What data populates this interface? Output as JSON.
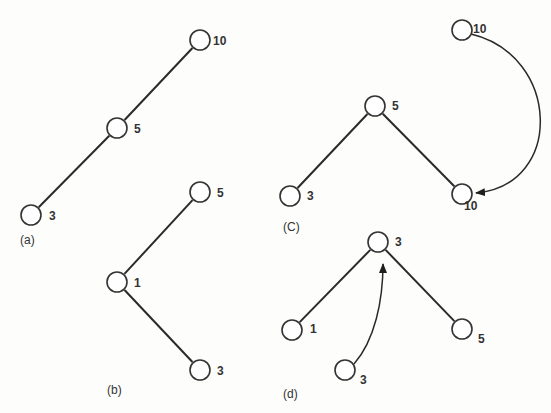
{
  "figure": {
    "node_radius": 10,
    "colors": {
      "stroke": "#333333",
      "edge": "#2a2a2a",
      "background": "#fdfdfc"
    },
    "panels": [
      {
        "id": "a",
        "label": "(a)",
        "label_pos": [
          20,
          244
        ],
        "nodes": [
          {
            "id": "a10",
            "key": "10",
            "x": 200,
            "y": 40,
            "label_dx": 13,
            "label_dy": 5
          },
          {
            "id": "a5",
            "key": "5",
            "x": 117,
            "y": 128,
            "label_dx": 17,
            "label_dy": 5
          },
          {
            "id": "a3",
            "key": "3",
            "x": 31,
            "y": 215,
            "label_dx": 18,
            "label_dy": 5
          }
        ],
        "edges": [
          [
            "a10",
            "a5"
          ],
          [
            "a5",
            "a3"
          ]
        ],
        "arrows": []
      },
      {
        "id": "b",
        "label": "(b)",
        "label_pos": [
          107,
          394
        ],
        "nodes": [
          {
            "id": "b5",
            "key": "5",
            "x": 200,
            "y": 192,
            "label_dx": 17,
            "label_dy": 5
          },
          {
            "id": "b1",
            "key": "1",
            "x": 117,
            "y": 282,
            "label_dx": 17,
            "label_dy": 5
          },
          {
            "id": "b3",
            "key": "3",
            "x": 200,
            "y": 370,
            "label_dx": 17,
            "label_dy": 5
          }
        ],
        "edges": [
          [
            "b5",
            "b1"
          ],
          [
            "b1",
            "b3"
          ]
        ],
        "arrows": []
      },
      {
        "id": "c",
        "label": "(C)",
        "label_pos": [
          283,
          231
        ],
        "nodes": [
          {
            "id": "c10top",
            "key": "10",
            "x": 462,
            "y": 30,
            "label_dx": 11,
            "label_dy": 3
          },
          {
            "id": "c5",
            "key": "5",
            "x": 375,
            "y": 106,
            "label_dx": 17,
            "label_dy": 4
          },
          {
            "id": "c3",
            "key": "3",
            "x": 290,
            "y": 196,
            "label_dx": 17,
            "label_dy": 4
          },
          {
            "id": "c10bot",
            "key": "10",
            "x": 462,
            "y": 194,
            "label_dx": 2,
            "label_dy": 16
          }
        ],
        "edges": [
          [
            "c5",
            "c3"
          ],
          [
            "c5",
            "c10bot"
          ]
        ],
        "arrows": [
          {
            "from": "c10top",
            "to": "c10bot",
            "path": "M 471 34 C 560 55, 565 185, 476 193"
          }
        ]
      },
      {
        "id": "d",
        "label": "(d)",
        "label_pos": [
          283,
          398
        ],
        "nodes": [
          {
            "id": "d3top",
            "key": "3",
            "x": 378,
            "y": 242,
            "label_dx": 17,
            "label_dy": 4
          },
          {
            "id": "d1",
            "key": "1",
            "x": 292,
            "y": 330,
            "label_dx": 18,
            "label_dy": 3
          },
          {
            "id": "d5",
            "key": "5",
            "x": 462,
            "y": 329,
            "label_dx": 16,
            "label_dy": 14
          },
          {
            "id": "d3new",
            "key": "3",
            "x": 345,
            "y": 370,
            "label_dx": 15,
            "label_dy": 14
          }
        ],
        "edges": [
          [
            "d3top",
            "d1"
          ],
          [
            "d3top",
            "d5"
          ]
        ],
        "arrows": [
          {
            "from": "d3new",
            "to": "d3top",
            "path": "M 354 364 C 375 340, 383 300, 383 264"
          }
        ]
      }
    ]
  }
}
